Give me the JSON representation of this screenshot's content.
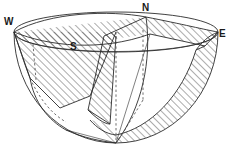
{
  "figure": {
    "type": "line-diagram",
    "background_color": "#ffffff",
    "stroke_color": "#2b2b2b",
    "hatch_color": "#3a3a3a",
    "canvas": {
      "width": 230,
      "height": 148
    }
  },
  "labels": {
    "west": "W",
    "north": "N",
    "east": "E",
    "south": "S"
  },
  "label_positions": {
    "west": {
      "x": 4,
      "y": 25
    },
    "north": {
      "x": 142,
      "y": 11
    },
    "east": {
      "x": 219,
      "y": 37
    },
    "south": {
      "x": 70,
      "y": 50
    }
  },
  "geometry": {
    "sphere_center": {
      "x": 116,
      "y": 32
    },
    "sphere_radius_x": 102,
    "sphere_radius_y": 111,
    "rim_ellipse_ry": 20,
    "bowl_bottom": {
      "x": 116,
      "y": 143
    },
    "horizon_rim_left": {
      "x": 14,
      "y": 32
    },
    "horizon_rim_right": {
      "x": 218,
      "y": 32
    },
    "apex_north": {
      "x": 146,
      "y": 17
    },
    "hatch_angle_deg": 45,
    "hatch_spacing_px": 5
  },
  "regions": [
    {
      "name": "west-wedge",
      "hatched": true
    },
    {
      "name": "south-wedge",
      "hatched": true
    },
    {
      "name": "central-cone",
      "hatched": true
    },
    {
      "name": "east-lune",
      "hatched": true
    },
    {
      "name": "bottom-lune",
      "hatched": true
    },
    {
      "name": "lower-left-open-sector",
      "hatched": false
    }
  ]
}
